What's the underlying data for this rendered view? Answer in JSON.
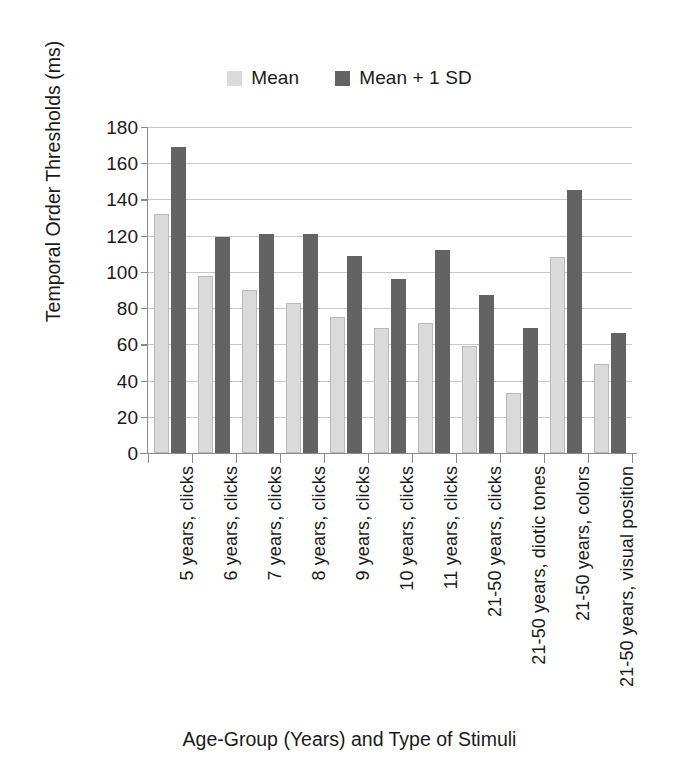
{
  "chart_data": {
    "type": "bar",
    "title": "",
    "xlabel": "Age-Group (Years) and Type of Stimuli",
    "ylabel": "Temporal Order Thresholds (ms)",
    "ylim": [
      0,
      180
    ],
    "yticks": [
      0,
      20,
      40,
      60,
      80,
      100,
      120,
      140,
      160,
      180
    ],
    "grid": true,
    "legend_position": "top-center",
    "categories": [
      "5 years, clicks",
      "6 years, clicks",
      "7 years, clicks",
      "8 years, clicks",
      "9 years, clicks",
      "10 years, clicks",
      "11 years, clicks",
      "21-50 years, clicks",
      "21-50 years, diotic tones",
      "21-50 years, colors",
      "21-50 years, visual position"
    ],
    "series": [
      {
        "name": "Mean",
        "color": "#dadada",
        "values": [
          132,
          98,
          90,
          83,
          75,
          69,
          72,
          59,
          33,
          108,
          49
        ]
      },
      {
        "name": "Mean + 1 SD",
        "color": "#636363",
        "values": [
          169,
          119,
          121,
          121,
          109,
          96,
          112,
          87,
          69,
          145,
          66
        ]
      }
    ]
  },
  "legend": {
    "entries": [
      {
        "label": "Mean",
        "color": "#dadada"
      },
      {
        "label": "Mean + 1 SD",
        "color": "#636363"
      }
    ]
  },
  "axes": {
    "y_title": "Temporal Order Thresholds (ms)",
    "x_title": "Age-Group (Years) and Type of Stimuli"
  },
  "colors": {
    "mean": "#dadada",
    "mean_plus_sd": "#636363",
    "gridline": "#c8c8c8",
    "axis": "#8a8a8a",
    "text": "#1a1a1a",
    "background": "#ffffff"
  }
}
